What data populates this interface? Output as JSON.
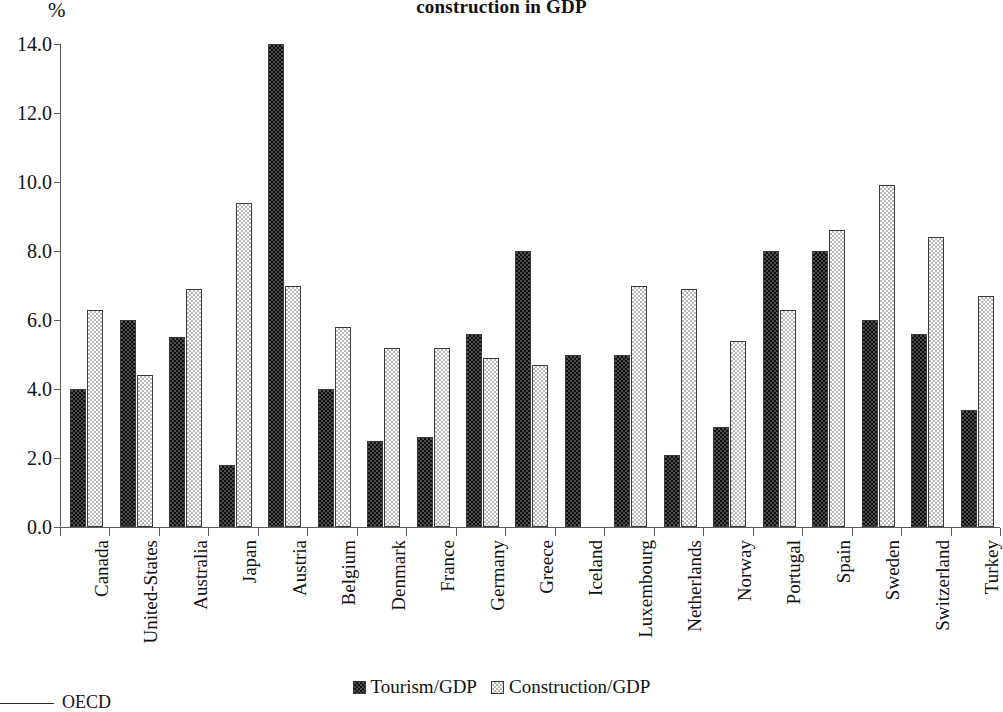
{
  "chart_data": {
    "type": "bar",
    "title": "Share of tourism and construction in GDP",
    "title_visible_line": "construction in GDP",
    "ylabel": "%",
    "xlabel": "",
    "ylim": [
      0.0,
      14.0
    ],
    "y_ticks": [
      "0.0",
      "2.0",
      "4.0",
      "6.0",
      "8.0",
      "10.0",
      "12.0",
      "14.0"
    ],
    "y_tick_values": [
      0,
      2,
      4,
      6,
      8,
      10,
      12,
      14
    ],
    "grid": false,
    "legend_position": "bottom-center",
    "categories": [
      "Canada",
      "United-States",
      "Australia",
      "Japan",
      "Austria",
      "Belgium",
      "Denmark",
      "France",
      "Germany",
      "Greece",
      "Iceland",
      "Luxembourg",
      "Netherlands",
      "Norway",
      "Portugal",
      "Spain",
      "Sweden",
      "Switzerland",
      "Turkey"
    ],
    "series": [
      {
        "name": "Tourism/GDP",
        "color": "#4d4d4d",
        "values": [
          4.0,
          6.0,
          5.5,
          1.8,
          14.0,
          4.0,
          2.5,
          2.6,
          5.6,
          8.0,
          5.0,
          5.0,
          2.1,
          2.9,
          8.0,
          8.0,
          6.0,
          5.6,
          3.4
        ]
      },
      {
        "name": "Construction/GDP",
        "color": "#e2e2e2",
        "values": [
          6.3,
          4.4,
          6.9,
          9.4,
          7.0,
          5.8,
          5.2,
          5.2,
          4.9,
          4.7,
          null,
          7.0,
          6.9,
          5.4,
          6.3,
          8.6,
          9.9,
          8.4,
          6.7
        ]
      }
    ]
  },
  "legend": {
    "items": [
      {
        "label": "Tourism/GDP"
      },
      {
        "label": "Construction/GDP"
      }
    ]
  },
  "source": {
    "label": "OECD"
  }
}
